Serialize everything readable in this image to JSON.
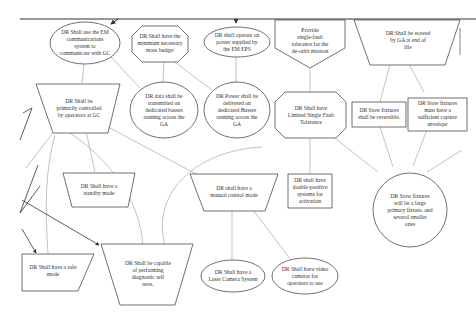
{
  "diagram": {
    "type": "requirements-tree",
    "nodes": [
      {
        "id": "em_comm",
        "shape": "ellipse",
        "text": "DR Shall use the EM\ncommunications\nsystem to\ncommunicate with GC"
      },
      {
        "id": "mass_budget",
        "shape": "octagon",
        "text": "DR Shall have the\nminimum necessary\nmass budget"
      },
      {
        "id": "em_eps",
        "shape": "ellipse",
        "text": "DR shall operate on\npower supplied by\nthe EM EPS"
      },
      {
        "id": "single_fault",
        "shape": "pentagon-down",
        "text": "Provide\nsingle-fault\ntolerance for the\nde-orbit mission"
      },
      {
        "id": "stowed",
        "shape": "trapezoid-inverted",
        "text": "DR Shall be stowed\nby GA at end of\nlife"
      },
      {
        "id": "operators_gc",
        "shape": "trapezoid-inverted",
        "text": "DR Shall be\nprimarily controlled\nby operators at GC"
      },
      {
        "id": "data_buses",
        "shape": "ellipse",
        "text": "DR data shall be\ntransmitted on\ndedicated busses\nrunning across the\nGA"
      },
      {
        "id": "power_buses",
        "shape": "ellipse",
        "text": "DR Power shall be\ndelivered on\ndedicated Busses\nrunning across the\nGA"
      },
      {
        "id": "limited_sft",
        "shape": "octagon",
        "text": "DR Shall have\nLimited Single Fault\nTolerance"
      },
      {
        "id": "stow_reversible",
        "shape": "rectangle",
        "text": "DR Stow fixtures\nshall be reversible."
      },
      {
        "id": "stow_envelope",
        "shape": "rectangle",
        "text": "DR Stow fixtures\nmust have a\nsufficient capture\nenvelope"
      },
      {
        "id": "standby",
        "shape": "trapezoid-inverted",
        "text": "DR Shall have a\nstandby mode"
      },
      {
        "id": "manual",
        "shape": "trapezoid-inverted",
        "text": "DR shall have a\nmanual control mode"
      },
      {
        "id": "double_positive",
        "shape": "rectangle",
        "text": "DR shall have\ndouble-positive\nsystems for\nactivation"
      },
      {
        "id": "stow_primary",
        "shape": "ellipse",
        "text": "DR Stow fixtures\nwill be a large\nprimary fixture, and\nseveral smaller\nones"
      },
      {
        "id": "safe_mode",
        "shape": "trapezoid-inverted",
        "text": "DR Shall have a safe\nmode"
      },
      {
        "id": "diagnostic",
        "shape": "trapezoid-inverted",
        "text": "DR Shall be capable\nof performing\ndiagnostic self\ntests."
      },
      {
        "id": "laser_camera",
        "shape": "ellipse",
        "text": "DR Shall have a\nLaser Camera System"
      },
      {
        "id": "video_cameras",
        "shape": "ellipse",
        "text": "DR Shall have video\ncameras for\noperators to use"
      }
    ],
    "edges": [
      {
        "from": "em_comm",
        "to": "operators_gc"
      },
      {
        "from": "em_comm",
        "to": "data_buses"
      },
      {
        "from": "mass_budget",
        "to": "data_buses"
      },
      {
        "from": "mass_budget",
        "to": "power_buses"
      },
      {
        "from": "em_eps",
        "to": "power_buses"
      },
      {
        "from": "single_fault",
        "to": "limited_sft"
      },
      {
        "from": "stowed",
        "to": "stow_reversible"
      },
      {
        "from": "stowed",
        "to": "stow_envelope"
      },
      {
        "from": "operators_gc",
        "to": "standby"
      },
      {
        "from": "operators_gc",
        "to": "manual"
      },
      {
        "from": "operators_gc",
        "to": "diagnostic"
      },
      {
        "from": "operators_gc",
        "to": "stow_primary"
      },
      {
        "from": "limited_sft",
        "to": "double_positive"
      },
      {
        "from": "limited_sft",
        "to": "stow_primary"
      },
      {
        "from": "limited_sft",
        "to": "diagnostic"
      },
      {
        "from": "stow_reversible",
        "to": "stow_primary"
      },
      {
        "from": "stow_envelope",
        "to": "stow_primary"
      },
      {
        "from": "manual",
        "to": "laser_camera"
      },
      {
        "from": "manual",
        "to": "video_cameras"
      },
      {
        "from": "standby",
        "to": "safe_mode"
      }
    ]
  }
}
